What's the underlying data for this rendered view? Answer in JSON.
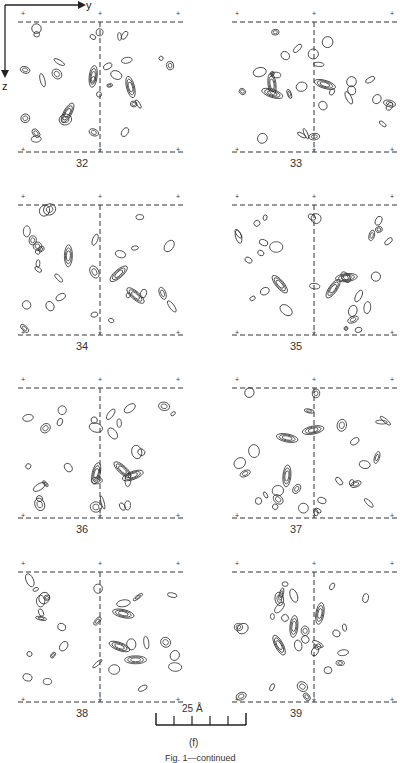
{
  "figure": {
    "axes": {
      "y_label": "y",
      "z_label": "z"
    },
    "panels": [
      {
        "id": "32",
        "label": "32",
        "col": 0,
        "row": 0
      },
      {
        "id": "33",
        "label": "33",
        "col": 1,
        "row": 0
      },
      {
        "id": "34",
        "label": "34",
        "col": 0,
        "row": 1
      },
      {
        "id": "35",
        "label": "35",
        "col": 1,
        "row": 1
      },
      {
        "id": "36",
        "label": "36",
        "col": 0,
        "row": 2
      },
      {
        "id": "37",
        "label": "37",
        "col": 1,
        "row": 2
      },
      {
        "id": "38",
        "label": "38",
        "col": 0,
        "row": 3
      },
      {
        "id": "39",
        "label": "39",
        "col": 1,
        "row": 3
      }
    ],
    "scale_bar": {
      "label": "25 Å",
      "divisions": 5
    },
    "part_label": "(f)",
    "caption": "Fig. 1—continued"
  }
}
